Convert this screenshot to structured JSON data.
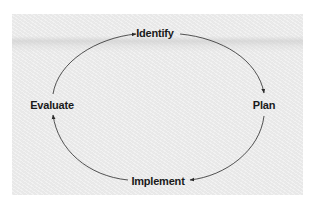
{
  "diagram": {
    "type": "cycle",
    "direction": "clockwise",
    "nodes": [
      {
        "id": "identify",
        "label": "Identify"
      },
      {
        "id": "plan",
        "label": "Plan"
      },
      {
        "id": "implement",
        "label": "Implement"
      },
      {
        "id": "evaluate",
        "label": "Evaluate"
      }
    ],
    "edges": [
      {
        "from": "identify",
        "to": "plan"
      },
      {
        "from": "plan",
        "to": "implement"
      },
      {
        "from": "implement",
        "to": "evaluate"
      },
      {
        "from": "evaluate",
        "to": "identify"
      }
    ],
    "colors": {
      "background": "#ededed",
      "line": "#2a2a2a",
      "text": "#1a1a1a"
    }
  }
}
